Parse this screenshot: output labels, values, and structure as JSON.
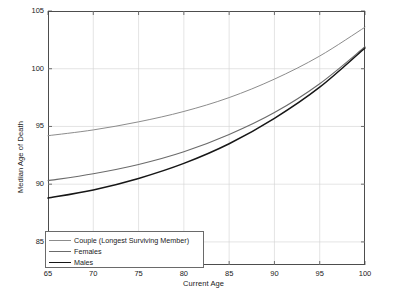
{
  "chart_data": {
    "type": "line",
    "title": "",
    "xlabel": "Current Age",
    "ylabel": "Median Age of Death",
    "xlim": [
      65,
      100
    ],
    "ylim": [
      83,
      105
    ],
    "xticks": [
      65,
      70,
      75,
      80,
      85,
      90,
      95,
      100
    ],
    "yticks": [
      85,
      90,
      95,
      100,
      105
    ],
    "xtick_labels": [
      "65",
      "70",
      "75",
      "80",
      "85",
      "90",
      "95",
      "100"
    ],
    "ytick_labels": [
      "85",
      "90",
      "95",
      "100",
      "105"
    ],
    "grid": true,
    "legend_position": "lower left",
    "x": [
      65,
      70,
      75,
      80,
      85,
      90,
      95,
      100
    ],
    "series": [
      {
        "name": "Couple (Longest Surviving Member)",
        "color": "#8c8c8c",
        "width": 1.0,
        "values": [
          94.2,
          94.7,
          95.4,
          96.3,
          97.5,
          99.1,
          101.1,
          103.6
        ]
      },
      {
        "name": "Females",
        "color": "#6b6b6b",
        "width": 1.1,
        "values": [
          90.3,
          90.9,
          91.7,
          92.8,
          94.3,
          96.2,
          98.7,
          101.9
        ]
      },
      {
        "name": "Males",
        "color": "#161616",
        "width": 1.5,
        "values": [
          88.8,
          89.5,
          90.5,
          91.8,
          93.5,
          95.7,
          98.4,
          101.8
        ]
      }
    ]
  },
  "legend": {
    "items": [
      {
        "label": "Couple (Longest Surviving Member)"
      },
      {
        "label": "Females"
      },
      {
        "label": "Males"
      }
    ]
  },
  "axes": {
    "x_title": "Current Age",
    "y_title": "Median Age of Death"
  }
}
